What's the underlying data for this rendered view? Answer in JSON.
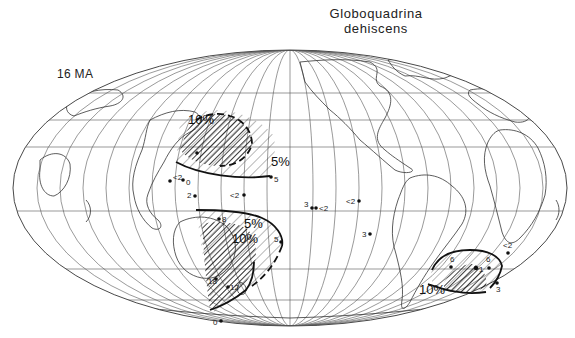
{
  "figure": {
    "title_line1": "Globoquadrina",
    "title_line2": "dehiscens",
    "age_label": "16 MA",
    "projection": "Mollweide, Pacific-centered",
    "ink_color": "#111111",
    "background_color": "#ffffff"
  },
  "contours": [
    {
      "label": "10%",
      "region": "northwest-pacific",
      "x": 176,
      "y": 124
    },
    {
      "label": "5%",
      "region": "northwest-pacific",
      "x": 268,
      "y": 161
    },
    {
      "label": "5%",
      "region": "southwest-pacific",
      "x": 252,
      "y": 229
    },
    {
      "label": "10%",
      "region": "southwest-pacific",
      "x": 232,
      "y": 241
    },
    {
      "label": "10%",
      "region": "south-atlantic",
      "x": 420,
      "y": 294
    }
  ],
  "samples": [
    {
      "value": "",
      "x": 194,
      "y": 152
    },
    {
      "value": "5",
      "x": 269,
      "y": 177
    },
    {
      "value": "<2",
      "x": 169,
      "y": 178
    },
    {
      "value": "0",
      "x": 182,
      "y": 178
    },
    {
      "value": "2",
      "x": 192,
      "y": 193
    },
    {
      "value": "<2",
      "x": 242,
      "y": 193
    },
    {
      "value": "3",
      "x": 307,
      "y": 206
    },
    {
      "value": "<2",
      "x": 311,
      "y": 206
    },
    {
      "value": "<2",
      "x": 354,
      "y": 198
    },
    {
      "value": "3",
      "x": 366,
      "y": 230
    },
    {
      "value": "8",
      "x": 217,
      "y": 214
    },
    {
      "value": "5",
      "x": 280,
      "y": 238
    },
    {
      "value": "18",
      "x": 216,
      "y": 276
    },
    {
      "value": "12",
      "x": 230,
      "y": 286
    },
    {
      "value": "0",
      "x": 218,
      "y": 319
    },
    {
      "value": "6",
      "x": 445,
      "y": 261
    },
    {
      "value": "",
      "x": 471,
      "y": 262
    },
    {
      "value": "6",
      "x": 484,
      "y": 262
    },
    {
      "value": "<2",
      "x": 505,
      "y": 248
    },
    {
      "value": "3",
      "x": 492,
      "y": 285
    }
  ],
  "sample_labels": {
    "s0": "<2",
    "s1": "0",
    "s2": "2",
    "s3": "<2",
    "s4": "5",
    "s5": "3",
    "s6": "<2",
    "s7": "<2",
    "s8": "3",
    "s9": "8",
    "s10": "5",
    "s11": "18",
    "s12": "12",
    "s13": "0",
    "s14": "6",
    "s15": "6",
    "s16": "<2",
    "s17": "3",
    "s18": "1"
  },
  "contour_labels": {
    "nw10": "10%",
    "nw5": "5%",
    "sw5": "5%",
    "sw10": "10%",
    "sa10": "10%"
  }
}
